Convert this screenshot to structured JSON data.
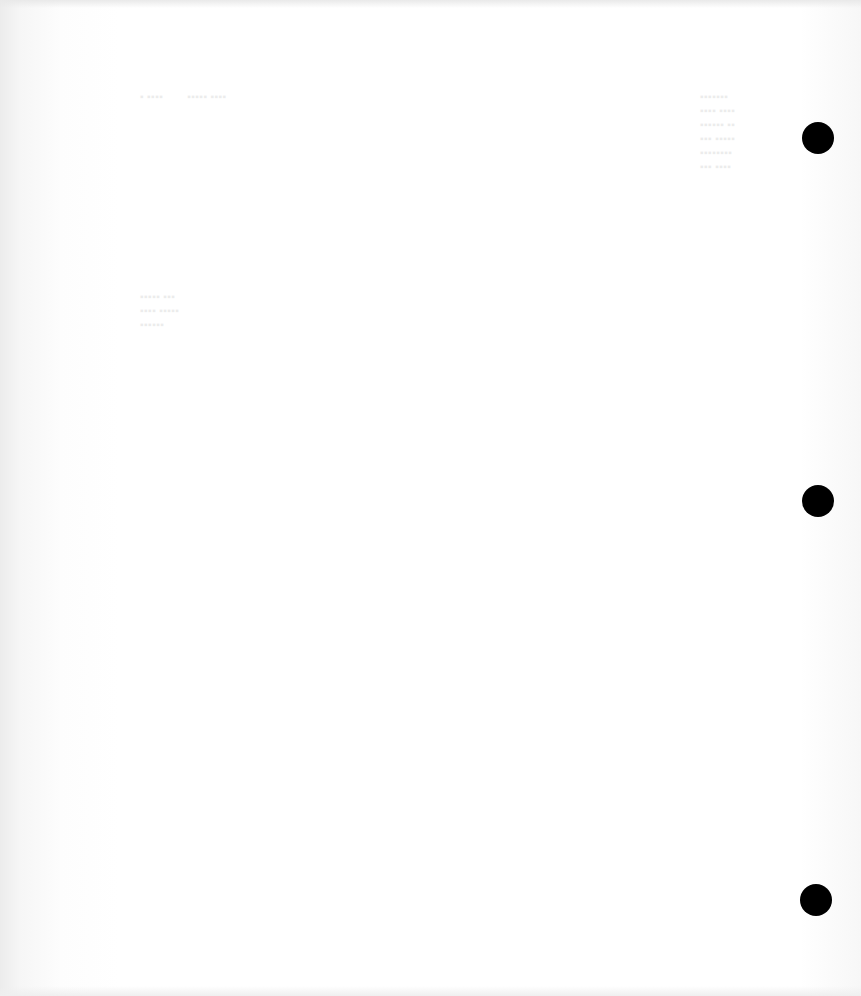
{
  "page": {
    "type": "scanned blank page (reverse side) with faint bleed-through",
    "background": "#ffffff",
    "bleed_through_text": "illegible",
    "punch_holes": [
      {
        "x": 802,
        "y": 122,
        "color": "#000000"
      },
      {
        "x": 802,
        "y": 485,
        "color": "#000000"
      },
      {
        "x": 800,
        "y": 884,
        "color": "#000000"
      }
    ]
  }
}
